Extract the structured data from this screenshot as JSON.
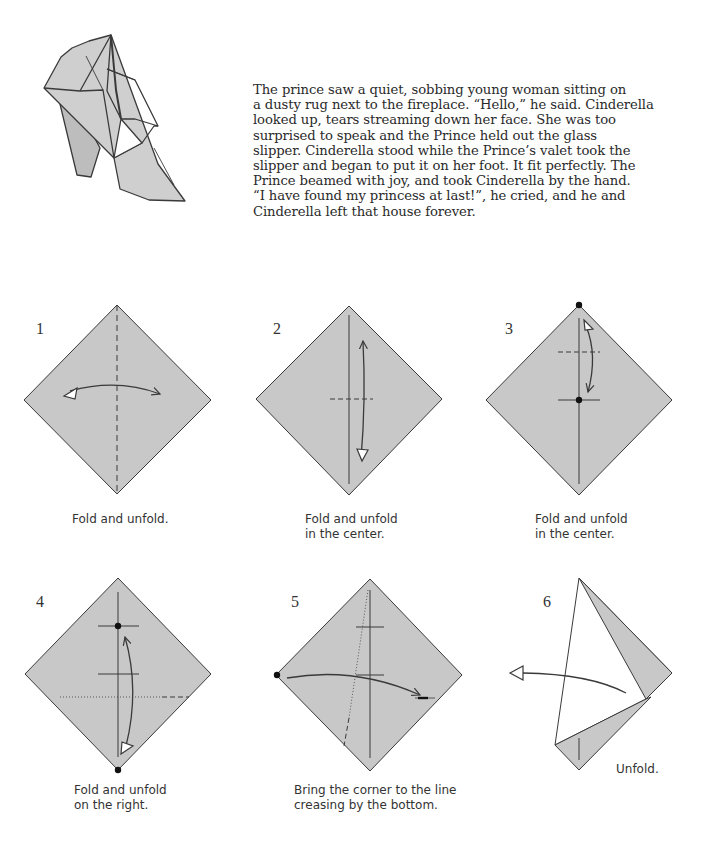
{
  "story": {
    "lines": [
      "The prince saw a quiet, sobbing young woman sitting on",
      "a dusty rug next to the fireplace. “Hello,” he said. Cinderella",
      "looked up, tears streaming down her face. She was too",
      "surprised to speak and the Prince held out the glass",
      "slipper. Cinderella stood while the Prince’s valet took the",
      "slipper and began to put it on her foot. It fit perfectly. The",
      "Prince beamed with joy, and took Cinderella by the hand.",
      "“I have found my princess at last!”, he cried, and he and",
      "Cinderella left that house forever."
    ]
  },
  "steps": [
    {
      "number": "1",
      "caption": [
        "Fold and unfold."
      ]
    },
    {
      "number": "2",
      "caption": [
        "Fold and unfold",
        "in the center."
      ]
    },
    {
      "number": "3",
      "caption": [
        "Fold and unfold",
        "in the center."
      ]
    },
    {
      "number": "4",
      "caption": [
        "Fold and unfold",
        "on the right."
      ]
    },
    {
      "number": "5",
      "caption": [
        "Bring the corner to the line",
        "creasing by the bottom."
      ]
    },
    {
      "number": "6",
      "caption": [
        "Unfold."
      ]
    }
  ],
  "colors": {
    "paper": "#c8c8c8",
    "line": "#3a3a3a",
    "background": "#ffffff"
  }
}
